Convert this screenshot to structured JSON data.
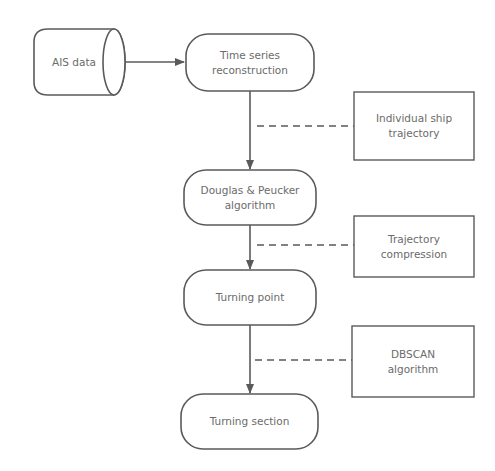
{
  "diagram": {
    "type": "flowchart",
    "colors": {
      "stroke": "#5a5a5a",
      "text": "#6b6b6b",
      "background": "#ffffff"
    },
    "nodes": {
      "ais_data": {
        "label": "AIS data",
        "shape": "cylinder"
      },
      "time_series": {
        "label": "Time series reconstruction",
        "line1": "Time series",
        "line2": "reconstruction",
        "shape": "rounded-rect"
      },
      "douglas": {
        "label": "Douglas & Peucker algorithm",
        "line1": "Douglas & Peucker",
        "line2": "algorithm",
        "shape": "rounded-rect"
      },
      "turning_point": {
        "label": "Turning point",
        "shape": "rounded-rect"
      },
      "turning_section": {
        "label": "Turning section",
        "shape": "rounded-rect"
      }
    },
    "annotations": {
      "individual": {
        "label": "Individual ship trajectory",
        "line1": "Individual ship",
        "line2": "trajectory",
        "shape": "rect"
      },
      "compression": {
        "label": "Trajectory compression",
        "line1": "Trajectory",
        "line2": "compression",
        "shape": "rect"
      },
      "dbscan": {
        "label": "DBSCAN algorithm",
        "line1": "DBSCAN",
        "line2": "algorithm",
        "shape": "rect"
      }
    },
    "edges": [
      {
        "from": "AIS data",
        "to": "Time series reconstruction",
        "style": "solid-arrow"
      },
      {
        "from": "Time series reconstruction",
        "to": "Douglas & Peucker algorithm",
        "style": "solid-arrow"
      },
      {
        "from": "Douglas & Peucker algorithm",
        "to": "Turning point",
        "style": "solid-arrow"
      },
      {
        "from": "Turning point",
        "to": "Turning section",
        "style": "solid-arrow"
      },
      {
        "from": "Individual ship trajectory",
        "to": "edge 2",
        "style": "dashed"
      },
      {
        "from": "Trajectory compression",
        "to": "edge 3",
        "style": "dashed"
      },
      {
        "from": "DBSCAN algorithm",
        "to": "edge 4",
        "style": "dashed"
      }
    ]
  }
}
